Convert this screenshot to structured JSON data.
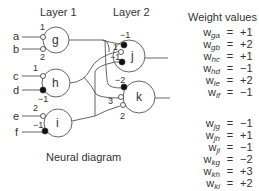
{
  "diagram": {
    "layer1_label": "Layer 1",
    "layer2_label": "Layer 2",
    "caption": "Neural diagram",
    "inputs": [
      "a",
      "b",
      "c",
      "d",
      "e",
      "f"
    ],
    "layer1_neurons": [
      "g",
      "h",
      "i"
    ],
    "layer2_neurons": [
      "j",
      "k"
    ],
    "synapse_labels": {
      "ga": "1",
      "gb": "2",
      "hc": "1",
      "hd": "−1",
      "ie": "2",
      "if": "−1",
      "jg": "−1",
      "jh": "1",
      "ji": "−1",
      "kg": "−2",
      "kh": "3",
      "ki": "2"
    },
    "colors": {
      "line": "#555555",
      "excitatory": "#ffffff",
      "inhibitory": "#111111"
    }
  },
  "weights": {
    "title": "Weight values",
    "group1": [
      {
        "w": "w",
        "sub": "ga",
        "eq": "=",
        "val": "+1"
      },
      {
        "w": "w",
        "sub": "gb",
        "eq": "=",
        "val": "+2"
      },
      {
        "w": "w",
        "sub": "hc",
        "eq": "=",
        "val": "+1"
      },
      {
        "w": "w",
        "sub": "hd",
        "eq": "=",
        "val": "−1"
      },
      {
        "w": "w",
        "sub": "ie",
        "eq": "=",
        "val": "+2"
      },
      {
        "w": "w",
        "sub": "if",
        "eq": "=",
        "val": "−1"
      }
    ],
    "group2": [
      {
        "w": "w",
        "sub": "jg",
        "eq": "=",
        "val": "−1"
      },
      {
        "w": "w",
        "sub": "jh",
        "eq": "=",
        "val": "+1"
      },
      {
        "w": "w",
        "sub": "ji",
        "eq": "=",
        "val": "−1"
      },
      {
        "w": "w",
        "sub": "kg",
        "eq": "=",
        "val": "−2"
      },
      {
        "w": "w",
        "sub": "kh",
        "eq": "=",
        "val": "+3"
      },
      {
        "w": "w",
        "sub": "ki",
        "eq": "=",
        "val": "+2"
      }
    ]
  }
}
